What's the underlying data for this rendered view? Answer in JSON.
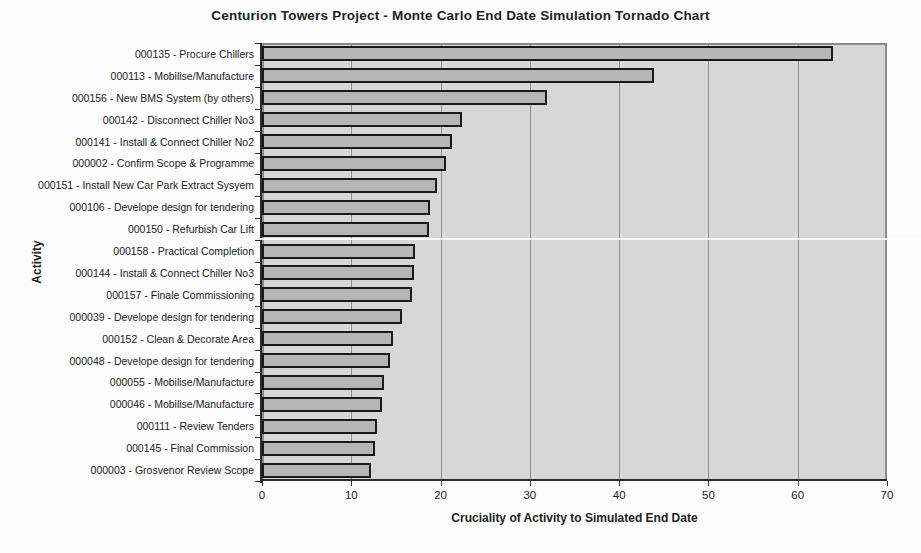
{
  "chart_data": {
    "type": "bar",
    "orientation": "horizontal",
    "title": "Centurion Towers Project - Monte Carlo End Date Simulation Tornado Chart",
    "xlabel": "Cruciality of Activity to Simulated End Date",
    "ylabel": "Activity",
    "xlim": [
      0,
      70
    ],
    "xticks": [
      0,
      10,
      20,
      30,
      40,
      50,
      60,
      70
    ],
    "grid": true,
    "legend": "none",
    "categories": [
      "000135 - Procure Chillers",
      "000113 - Mobilise/Manufacture",
      "000156 - New BMS System (by others)",
      "000142 - Disconnect Chiller No3",
      "000141 - Install & Connect Chiller No2",
      "000002 - Confirm Scope & Programme",
      "000151 - Install New Car Park Extract Sysyem",
      "000106 - Develope design for tendering",
      "000150 - Refurbish Car Lift",
      "000158 - Practical Completion",
      "000144 - Install & Connect Chiller No3",
      "000157 - Finale Commissioning",
      "000039 - Develope design for tendering",
      "000152 - Clean & Decorate Area",
      "000048 - Develope design for tendering",
      "000055 - Mobilise/Manufacture",
      "000046 - Mobilise/Manufacture",
      "000111 - Review Tenders",
      "000145 - Final Commission",
      "000003 - Grosvenor Review Scope"
    ],
    "values": [
      63.5,
      43.5,
      31.5,
      22,
      20.8,
      20.2,
      19.1,
      18.4,
      18.2,
      16.7,
      16.6,
      16.4,
      15.2,
      14.2,
      13.9,
      13.2,
      13.0,
      12.4,
      12.2,
      11.8
    ],
    "colors": {
      "plot_bg": "#d7d7d7",
      "plot_border": "#8a8a8a",
      "bar_fill": "#b5b5b5",
      "bar_border": "#1a1a1a",
      "gridline": "#8f8f8f",
      "axis": "#2a2a2a",
      "text": "#222222",
      "page_bg": "#fcfcfc"
    }
  }
}
